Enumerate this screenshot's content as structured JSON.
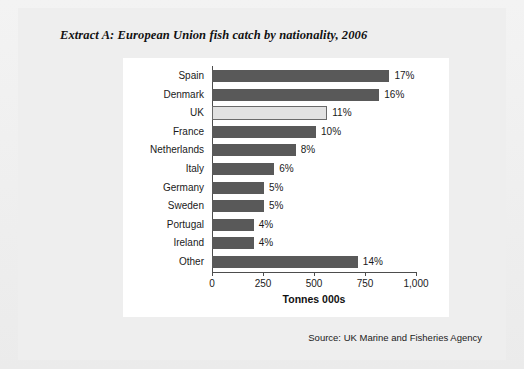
{
  "document": {
    "extract_title": "Extract A: European Union fish catch by nationality, 2006",
    "source_note": "Source: UK Marine and Fisheries Agency"
  },
  "colors": {
    "bar": "#595959",
    "bar_highlight": "#e2e2e2",
    "bar_highlight_border": "#6a6a6a",
    "panel_background": "#ffffff",
    "page_background": "#eeeeee",
    "axis": "#4d4d4d",
    "text": "#1a1a1a"
  },
  "chart_data": {
    "type": "bar",
    "orientation": "horizontal",
    "title": "Extract A: European Union fish catch by nationality, 2006",
    "xlabel": "Tonnes 000s",
    "ylabel": "",
    "xlim": [
      0,
      1000
    ],
    "xticks": [
      0,
      250,
      500,
      750,
      1000
    ],
    "xtick_labels": [
      "0",
      "250",
      "500",
      "750",
      "1,000"
    ],
    "grid": false,
    "legend": false,
    "categories": [
      "Spain",
      "Denmark",
      "UK",
      "France",
      "Netherlands",
      "Italy",
      "Germany",
      "Sweden",
      "Portugal",
      "Ireland",
      "Other"
    ],
    "values": [
      870,
      820,
      565,
      510,
      410,
      305,
      255,
      255,
      205,
      205,
      715
    ],
    "data_labels": [
      "17%",
      "16%",
      "11%",
      "10%",
      "8%",
      "6%",
      "5%",
      "5%",
      "4%",
      "4%",
      "14%"
    ],
    "highlighted_category": "UK",
    "bars": [
      {
        "label": "Spain",
        "value": 870,
        "percent": "17%",
        "highlight": false
      },
      {
        "label": "Denmark",
        "value": 820,
        "percent": "16%",
        "highlight": false
      },
      {
        "label": "UK",
        "value": 565,
        "percent": "11%",
        "highlight": true
      },
      {
        "label": "France",
        "value": 510,
        "percent": "10%",
        "highlight": false
      },
      {
        "label": "Netherlands",
        "value": 410,
        "percent": "8%",
        "highlight": false
      },
      {
        "label": "Italy",
        "value": 305,
        "percent": "6%",
        "highlight": false
      },
      {
        "label": "Germany",
        "value": 255,
        "percent": "5%",
        "highlight": false
      },
      {
        "label": "Sweden",
        "value": 255,
        "percent": "5%",
        "highlight": false
      },
      {
        "label": "Portugal",
        "value": 205,
        "percent": "4%",
        "highlight": false
      },
      {
        "label": "Ireland",
        "value": 205,
        "percent": "4%",
        "highlight": false
      },
      {
        "label": "Other",
        "value": 715,
        "percent": "14%",
        "highlight": false
      }
    ]
  }
}
